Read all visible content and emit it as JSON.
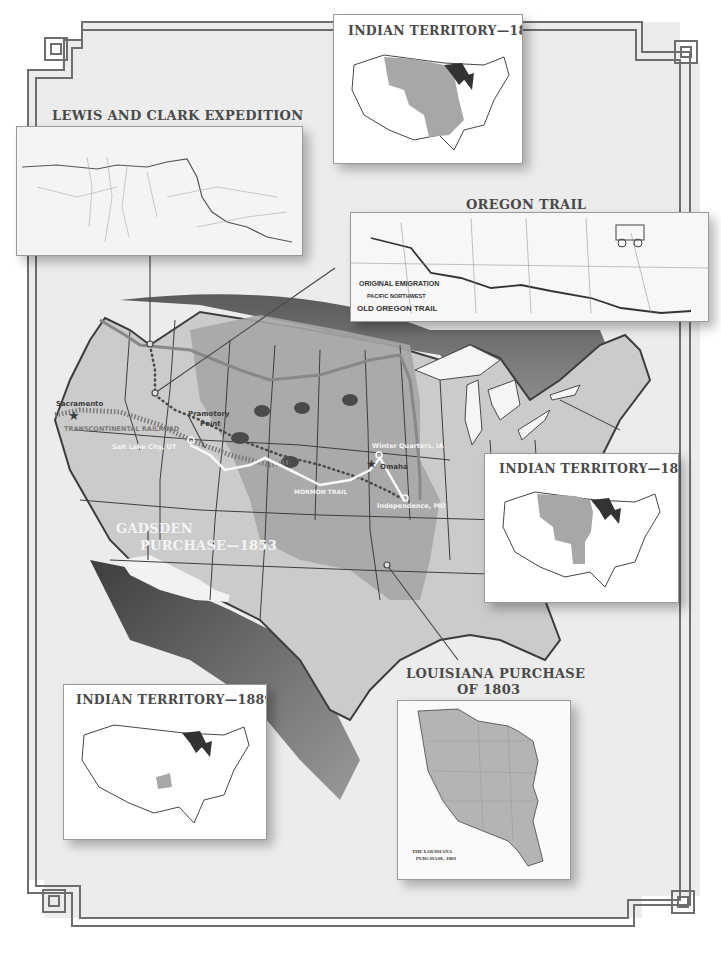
{
  "colors": {
    "background": "#ebebeb",
    "frame": "#6e6e6e",
    "land": "#c9c9c9",
    "territory": "#a4a4a4",
    "dark_shade": "#545454",
    "water": "#f2f2f2",
    "inset_territory": "#a7a7a7",
    "great_lakes_inset": "#333333"
  },
  "insets": {
    "indian_territory_1810": {
      "title": "INDIAN TERRITORY—1810"
    },
    "lewis_and_clark": {
      "title": "LEWIS AND CLARK EXPEDITION"
    },
    "oregon_trail": {
      "title": "OREGON TRAIL",
      "map_caption_line1": "ORIGINAL EMIGRATION",
      "map_caption_line2": "PACIFIC NORTHWEST",
      "map_caption_line3": "OLD OREGON TRAIL",
      "map_states": [
        "OREGON",
        "MONTANA",
        "WYOMING",
        "N. DAKOTA",
        "S. DAKOTA",
        "NEBRASKA",
        "IOWA",
        "UTAH",
        "COLORADO",
        "KANSAS",
        "MISSOURI",
        "ILLINOIS"
      ]
    },
    "indian_territory_1834": {
      "title": "INDIAN TERRITORY—1834"
    },
    "indian_territory_1889": {
      "title": "INDIAN TERRITORY—1889"
    },
    "louisiana_purchase": {
      "title_line1": "LOUISIANA PURCHASE",
      "title_line2": "OF 1803",
      "map_caption_line1": "THE LOUISIANA",
      "map_caption_line2": "PURCHASE, 1803",
      "map_labels": [
        "NEW MEXICO",
        "TEXAS",
        "COLORADO",
        "KANSAS",
        "NEBRASKA",
        "OKLAHOMA",
        "MISSOURI",
        "IOWA",
        "ARKANSAS"
      ]
    }
  },
  "map_labels": {
    "sacramento": "Sacramento",
    "promontory_point_line1": "Pramotory",
    "promontory_point_line2": "Point",
    "transcontinental_railroad": "TRANSCONTINENTAL RAILROAD",
    "salt_lake_city": "Salt Lake City, UT",
    "winter_quarters": "Winter Quarters, IA",
    "omaha": "Omaha",
    "mormon_trail": "MORMON TRAIL",
    "independence": "Independence, MO",
    "gadsden_line1": "GADSDEN",
    "gadsden_line2": "PURCHASE—1853"
  }
}
